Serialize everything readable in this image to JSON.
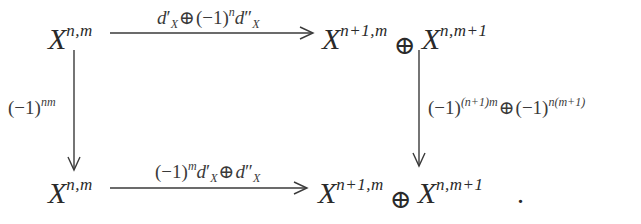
{
  "diagram": {
    "type": "commutative-square",
    "nodes": {
      "top_left": {
        "base": "X",
        "sup": "n,m"
      },
      "top_right": {
        "left": {
          "base": "X",
          "sup": "n+1,m"
        },
        "op": "⊕",
        "right": {
          "base": "X",
          "sup": "n,m+1"
        }
      },
      "bottom_left": {
        "base": "X",
        "sup": "n,m"
      },
      "bottom_right": {
        "left": {
          "base": "X",
          "sup": "n+1,m"
        },
        "op": "⊕",
        "right": {
          "base": "X",
          "sup": "n,m+1"
        },
        "trailing": "."
      }
    },
    "arrows": {
      "top": {
        "from": "top_left",
        "to": "top_right",
        "label": "d′_X ⊕ (−1)^n d″_X",
        "parts": {
          "d1": "d",
          "prime1": "′",
          "sub1": "X",
          "op": "⊕",
          "paren": "(−1)",
          "exp": "n",
          "d2": "d",
          "prime2": "″",
          "sub2": "X"
        }
      },
      "bottom": {
        "from": "bottom_left",
        "to": "bottom_right",
        "label": "(−1)^m d′_X ⊕ d″_X",
        "parts": {
          "paren": "(−1)",
          "exp": "m",
          "d1": "d",
          "prime1": "′",
          "sub1": "X",
          "op": "⊕",
          "d2": "d",
          "prime2": "″",
          "sub2": "X"
        }
      },
      "left": {
        "from": "top_left",
        "to": "bottom_left",
        "label": "(−1)^{nm}",
        "parts": {
          "paren": "(−1)",
          "exp": "nm"
        }
      },
      "right": {
        "from": "top_right",
        "to": "bottom_right",
        "label": "(−1)^{(n+1)m} ⊕ (−1)^{n(m+1)}",
        "parts": {
          "paren1": "(−1)",
          "exp1": "(n+1)m",
          "op": "⊕",
          "paren2": "(−1)",
          "exp2": "n(m+1)"
        }
      }
    },
    "colors": {
      "ink": "#2a2a2a",
      "background": "#ffffff"
    }
  }
}
